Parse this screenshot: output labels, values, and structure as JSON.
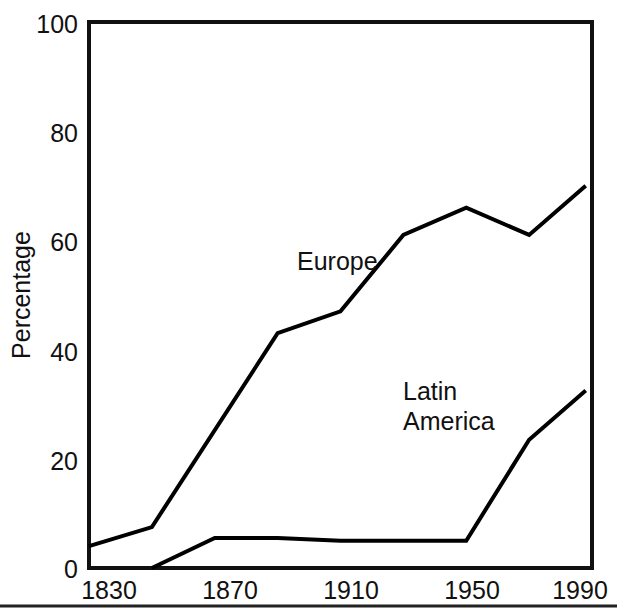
{
  "chart_data": {
    "type": "line",
    "title": "",
    "subtitle": "",
    "xlabel": "",
    "ylabel": "Percentage",
    "xlim": [
      1830,
      1990
    ],
    "ylim": [
      0,
      100
    ],
    "grid": false,
    "legend_position": "inline-annotations",
    "x_ticks": [
      1830,
      1870,
      1910,
      1950,
      1990
    ],
    "x_tick_labels": [
      "1830",
      "1870",
      "1910",
      "1950",
      "1990"
    ],
    "y_ticks": [
      0,
      20,
      40,
      60,
      80,
      100
    ],
    "y_tick_labels": [
      "0",
      "20",
      "40",
      "60",
      "80",
      "100"
    ],
    "series": [
      {
        "name": "Europe",
        "label_text": "Europe",
        "color": "#000000",
        "x": [
          1830,
          1850,
          1890,
          1910,
          1930,
          1950,
          1970,
          1988
        ],
        "values": [
          4,
          7.5,
          43,
          47,
          61,
          66,
          61,
          70
        ]
      },
      {
        "name": "Latin America",
        "label_text_line1": "Latin",
        "label_text_line2": "America",
        "color": "#000000",
        "x": [
          1850,
          1870,
          1890,
          1910,
          1950,
          1970,
          1988
        ],
        "values": [
          0,
          5.5,
          5.5,
          5,
          5,
          23.5,
          32.5
        ]
      }
    ],
    "annotations": [
      {
        "text": "Europe",
        "x": 1890,
        "y": 56
      },
      {
        "text": "Latin",
        "x": 1925,
        "y": 37
      },
      {
        "text": "America",
        "x": 1925,
        "y": 32
      }
    ]
  },
  "figure": {
    "background_color": "#ffffff",
    "line_color": "#000000",
    "text_color": "#111111",
    "frame_visible": true,
    "footer_rule_visible": true
  }
}
